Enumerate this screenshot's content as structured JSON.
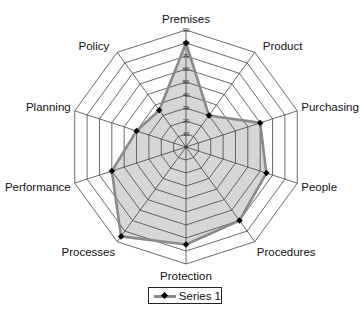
{
  "chart_data": {
    "type": "radar",
    "title": "",
    "categories": [
      "Premises",
      "Product",
      "Purchasing",
      "People",
      "Procedures",
      "Protection",
      "Processes",
      "Performance",
      "Planning",
      "Policy"
    ],
    "series": [
      {
        "name": "Series 1",
        "values": [
          80,
          30,
          60,
          65,
          70,
          75,
          85,
          60,
          40,
          35
        ],
        "line_color": "#8a8a8a",
        "fill_color": "#d6d6d6",
        "marker_color": "#000000"
      }
    ],
    "rlim": [
      0,
      90
    ],
    "ticks": [
      0,
      10,
      20,
      30,
      40,
      50,
      60,
      70,
      80,
      90
    ],
    "tick_labels": [
      "0",
      "10",
      "20",
      "30",
      "40",
      "50",
      "60",
      "70",
      "80",
      "90"
    ],
    "grid": true,
    "legend_position": "bottom"
  },
  "legend": {
    "label": "Series 1"
  }
}
